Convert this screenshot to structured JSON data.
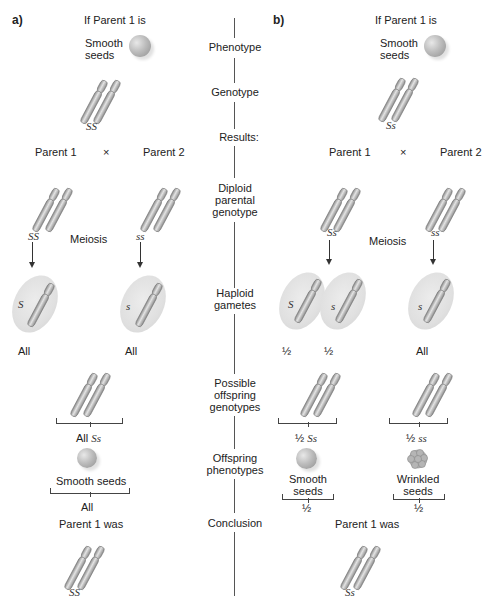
{
  "panels": {
    "a": {
      "label": "a)",
      "premise": "If Parent 1 is",
      "phenotype": "Smooth\nseeds",
      "phenotype_line1": "Smooth",
      "phenotype_line2": "seeds",
      "genotype": "SS",
      "parent1": "Parent 1",
      "cross": "×",
      "parent2": "Parent 2",
      "parent1_genotype": "SS",
      "parent2_genotype": "ss",
      "meiosis": "Meiosis",
      "gamete1_allele": "S",
      "gamete1_freq": "All",
      "gamete2_allele": "s",
      "gamete2_freq": "All",
      "offspring_genotype_prefix": "All",
      "offspring_genotype": "Ss",
      "offspring_phenotype": "Smooth seeds",
      "offspring_phenotype_freq": "All",
      "conclusion_label": "Parent 1 was",
      "conclusion_genotype": "SS"
    },
    "b": {
      "label": "b)",
      "premise": "If Parent 1 is",
      "phenotype_line1": "Smooth",
      "phenotype_line2": "seeds",
      "genotype": "Ss",
      "parent1": "Parent 1",
      "cross": "×",
      "parent2": "Parent 2",
      "parent1_genotype": "Ss",
      "parent2_genotype": "ss",
      "meiosis": "Meiosis",
      "gamete1_allele": "S",
      "gamete1_freq": "½",
      "gamete2_allele": "s",
      "gamete2_freq": "½",
      "gamete3_allele": "s",
      "gamete3_freq": "All",
      "offspring1_prefix": "½",
      "offspring1_genotype": "Ss",
      "offspring2_prefix": "½",
      "offspring2_genotype": "ss",
      "offspring1_phenotype_line1": "Smooth",
      "offspring1_phenotype_line2": "seeds",
      "offspring1_freq": "½",
      "offspring2_phenotype_line1": "Wrinkled",
      "offspring2_phenotype_line2": "seeds",
      "offspring2_freq": "½",
      "conclusion_label": "Parent 1 was",
      "conclusion_genotype": "Ss"
    }
  },
  "center_labels": {
    "phenotype": "Phenotype",
    "genotype": "Genotype",
    "results": "Results:",
    "diploid_1": "Diploid",
    "diploid_2": "parental",
    "diploid_3": "genotype",
    "haploid_1": "Haploid",
    "haploid_2": "gametes",
    "possible_1": "Possible",
    "possible_2": "offspring",
    "possible_3": "genotypes",
    "offspring_ph_1": "Offspring",
    "offspring_ph_2": "phenotypes",
    "conclusion": "Conclusion"
  },
  "colors": {
    "chromosome": "#a8a8a8",
    "chromosome_dark": "#7a7a7a",
    "gamete_halo": "#e0e0e0",
    "line": "#555555"
  }
}
